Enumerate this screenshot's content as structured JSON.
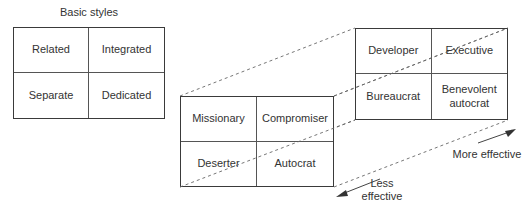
{
  "diagram": {
    "title": "Basic styles",
    "basic_styles": {
      "cells": [
        "Related",
        "Integrated",
        "Separate",
        "Dedicated"
      ]
    },
    "less_effective_styles": {
      "cells": [
        "Missionary",
        "Compromiser",
        "Deserter",
        "Autocrat"
      ]
    },
    "more_effective_styles": {
      "cells": [
        "Developer",
        "Executive",
        "Bureaucrat",
        "Benevolent autocrat"
      ]
    },
    "axis": {
      "more_label": "More effective",
      "less_label": "Less effective"
    },
    "colors": {
      "line": "#3a3a3a",
      "dashed": "#555555",
      "text": "#333333"
    }
  }
}
